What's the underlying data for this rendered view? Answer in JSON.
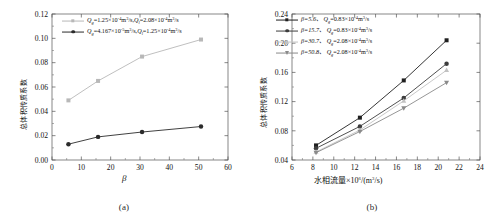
{
  "figure": {
    "panel_a_caption": "(a)",
    "panel_b_caption": "(b)"
  },
  "chart_data": [
    {
      "id": "panel-a",
      "type": "line",
      "title": "",
      "xlabel": "β",
      "ylabel": "总体积传质系数",
      "xlim": [
        0,
        60
      ],
      "ylim": [
        0.0,
        0.12
      ],
      "xticks": [
        0,
        10,
        20,
        30,
        40,
        50,
        60
      ],
      "xticklabels": [
        "0",
        "10",
        "20",
        "30",
        "40",
        "50",
        "60"
      ],
      "yticks": [
        0.0,
        0.02,
        0.04,
        0.06,
        0.08,
        0.1,
        0.12
      ],
      "yticklabels": [
        "0.00",
        "0.02",
        "0.04",
        "0.06",
        "0.08",
        "0.10",
        "0.12"
      ],
      "grid": false,
      "legend_position": "upper-left",
      "x": [
        5.6,
        15.7,
        30.7,
        50.8
      ],
      "series": [
        {
          "name": "Qg=1.25×10⁻⁴m³/s, Ql=2.08×10⁻⁴m³/s",
          "legend_parts": {
            "sym1": "Q",
            "sub1": "g",
            "val1": "=1.25×10",
            "exp1": "-4",
            "unit1": "m",
            "unitexp1": "3",
            "tail1": "/s,",
            "sym2": "Q",
            "sub2": "l",
            "val2": "=2.08×10",
            "exp2": "-4",
            "unit2": "m",
            "unitexp2": "3",
            "tail2": "/s"
          },
          "marker": "square",
          "color": "#b8b8b8",
          "values": [
            0.049,
            0.065,
            0.085,
            0.099
          ]
        },
        {
          "name": "Qg=4.167×10⁻⁵m³/s, Ql=1.25×10⁻⁴m³/s",
          "legend_parts": {
            "sym1": "Q",
            "sub1": "g",
            "val1": "=4.167×10",
            "exp1": "-5",
            "unit1": "m",
            "unitexp1": "3",
            "tail1": "/s,",
            "sym2": "Q",
            "sub2": "l",
            "val2": "=1.25×10",
            "exp2": "-4",
            "unit2": "m",
            "unitexp2": "3",
            "tail2": "/s"
          },
          "marker": "circle",
          "color": "#2b2b2b",
          "values": [
            0.013,
            0.019,
            0.023,
            0.0275
          ]
        }
      ]
    },
    {
      "id": "panel-b",
      "type": "line",
      "title": "",
      "xlabel": "水相流量×10⁶/(m³/s)",
      "xlabel_parts": {
        "pre": "水相流量×10",
        "exp": "6",
        "post": "/(m",
        "unitexp": "3",
        "post2": "/s)"
      },
      "ylabel": "总体积传质系数",
      "xlim": [
        6,
        24
      ],
      "ylim": [
        0.04,
        0.24
      ],
      "xticks": [
        6,
        8,
        10,
        12,
        14,
        16,
        18,
        20,
        22,
        24
      ],
      "xticklabels": [
        "6",
        "8",
        "10",
        "12",
        "14",
        "16",
        "18",
        "20",
        "22",
        "24"
      ],
      "yticks": [
        0.04,
        0.08,
        0.12,
        0.16,
        0.2,
        0.24
      ],
      "yticklabels": [
        "0.04",
        "0.08",
        "0.12",
        "0.16",
        "0.20",
        "0.24"
      ],
      "grid": false,
      "legend_position": "upper-left",
      "x": [
        8.3,
        12.5,
        16.7,
        20.8
      ],
      "series": [
        {
          "name": "β=5.6, Qg=0.83×10⁻⁴m³/s",
          "legend_parts": {
            "beta": "β=5.6、",
            "sym": "Q",
            "sub": "g",
            "val": "=0.83×10",
            "exp": "-4",
            "unit": "m",
            "unitexp": "3",
            "tail": "/s"
          },
          "marker": "square",
          "color": "#1f1f1f",
          "values": [
            0.06,
            0.098,
            0.149,
            0.204
          ]
        },
        {
          "name": "β=15.7, Qg=0.83×10⁻⁴m³/s",
          "legend_parts": {
            "beta": "β=15.7、",
            "sym": "Q",
            "sub": "g",
            "val": "=0.83×10",
            "exp": "-4",
            "unit": "m",
            "unitexp": "3",
            "tail": "/s"
          },
          "marker": "circle",
          "color": "#3d3d3d",
          "values": [
            0.056,
            0.086,
            0.125,
            0.172
          ]
        },
        {
          "name": "β=30.7, Qg=2.08×10⁻⁴m³/s",
          "legend_parts": {
            "beta": "β=30.7、",
            "sym": "Q",
            "sub": "g",
            "val": "=2.08×10",
            "exp": "-4",
            "unit": "m",
            "unitexp": "3",
            "tail": "/s"
          },
          "marker": "triangle-up",
          "color": "#c2c2c2",
          "values": [
            0.051,
            0.081,
            0.121,
            0.163
          ]
        },
        {
          "name": "β=50.8, Qg=2.08×10⁻⁴m³/s",
          "legend_parts": {
            "beta": "β=50.8、",
            "sym": "Q",
            "sub": "g",
            "val": "=2.08×10",
            "exp": "-4",
            "unit": "m",
            "unitexp": "3",
            "tail": "/s"
          },
          "marker": "triangle-down",
          "color": "#8a8a8a",
          "values": [
            0.05,
            0.079,
            0.111,
            0.146
          ]
        }
      ]
    }
  ]
}
